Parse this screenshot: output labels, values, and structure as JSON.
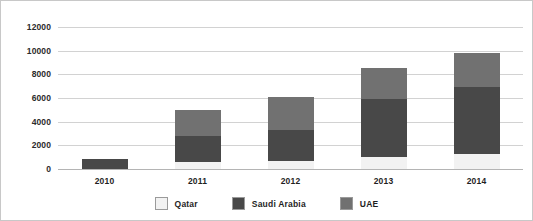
{
  "chart_data": {
    "type": "bar",
    "subtype": "stacked-vertical",
    "title": "",
    "xlabel": "",
    "ylabel": "",
    "categories": [
      "2010",
      "2011",
      "2012",
      "2013",
      "2014"
    ],
    "series": [
      {
        "name": "Qatar",
        "color": "#f2f2f2",
        "values": [
          0,
          600,
          700,
          1000,
          1250
        ]
      },
      {
        "name": "Saudi Arabia",
        "color": "#484848",
        "values": [
          850,
          2200,
          2600,
          4900,
          5700
        ]
      },
      {
        "name": "UAE",
        "color": "#717171",
        "values": [
          0,
          2150,
          2800,
          2650,
          2850
        ]
      }
    ],
    "totals": [
      850,
      4950,
      6100,
      8550,
      9800
    ],
    "ylim": [
      0,
      12000
    ],
    "yticks": [
      0,
      2000,
      4000,
      6000,
      8000,
      10000,
      12000
    ],
    "ytick_labels": [
      "0",
      "2000",
      "4000",
      "6000",
      "8000",
      "10000",
      "12000"
    ],
    "grid": true,
    "legend_position": "bottom"
  },
  "legend": {
    "items": [
      {
        "label": "Qatar",
        "color": "#f2f2f2"
      },
      {
        "label": "Saudi Arabia",
        "color": "#484848"
      },
      {
        "label": "UAE",
        "color": "#717171"
      }
    ]
  }
}
